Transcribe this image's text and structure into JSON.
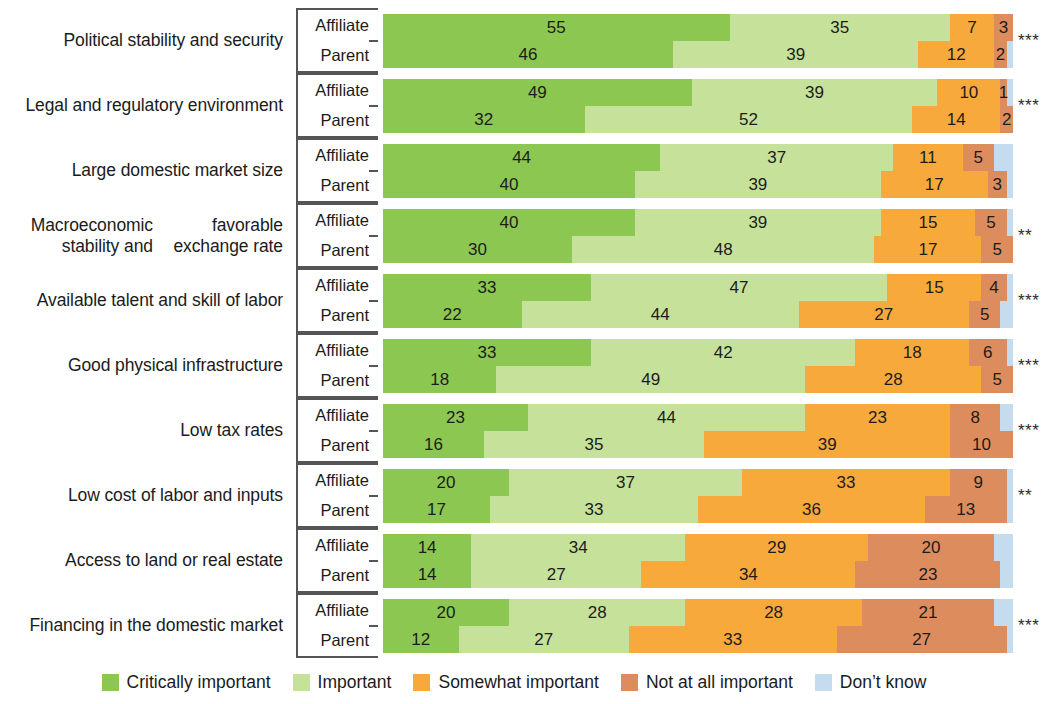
{
  "chart_data": {
    "type": "bar",
    "subtype": "horizontal-stacked-100",
    "title": "",
    "xlabel": "",
    "ylabel": "",
    "xlim": [
      0,
      100
    ],
    "grid": false,
    "legend_position": "bottom",
    "legend": [
      {
        "label": "Critically important",
        "color": "#8CC751"
      },
      {
        "label": "Important",
        "color": "#C6E29A"
      },
      {
        "label": "Somewhat important",
        "color": "#F7A93B"
      },
      {
        "label": "Not at all important",
        "color": "#DD8C5E"
      },
      {
        "label": "Don’t know",
        "color": "#C5DCEF"
      }
    ],
    "series_names": [
      "Affiliate",
      "Parent"
    ],
    "categories": [
      "Political stability and security",
      "Legal and regulatory environment",
      "Large domestic market size",
      "Macroeconomic stability and favorable exchange rate",
      "Available talent and skill of labor",
      "Good physical infrastructure",
      "Low tax rates",
      "Low cost of labor and inputs",
      "Access to land or real estate",
      "Financing in the domestic market"
    ],
    "rows": [
      {
        "category_lines": [
          "Political stability and security"
        ],
        "significance": "***",
        "affiliate": [
          55,
          35,
          7,
          3,
          0
        ],
        "parent": [
          46,
          39,
          12,
          2,
          1
        ]
      },
      {
        "category_lines": [
          "Legal and regulatory environment"
        ],
        "significance": "***",
        "affiliate": [
          49,
          39,
          10,
          1,
          1
        ],
        "parent": [
          32,
          52,
          14,
          2,
          0
        ]
      },
      {
        "category_lines": [
          "Large domestic market size"
        ],
        "significance": "",
        "affiliate": [
          44,
          37,
          11,
          5,
          3
        ],
        "parent": [
          40,
          39,
          17,
          3,
          1
        ]
      },
      {
        "category_lines": [
          "Macroeconomic stability and",
          "favorable exchange rate"
        ],
        "significance": "**",
        "affiliate": [
          40,
          39,
          15,
          5,
          1
        ],
        "parent": [
          30,
          48,
          17,
          5,
          0
        ]
      },
      {
        "category_lines": [
          "Available talent and skill of labor"
        ],
        "significance": "***",
        "affiliate": [
          33,
          47,
          15,
          4,
          1
        ],
        "parent": [
          22,
          44,
          27,
          5,
          2
        ]
      },
      {
        "category_lines": [
          "Good physical infrastructure"
        ],
        "significance": "***",
        "affiliate": [
          33,
          42,
          18,
          6,
          1
        ],
        "parent": [
          18,
          49,
          28,
          5,
          0
        ]
      },
      {
        "category_lines": [
          "Low tax rates"
        ],
        "significance": "***",
        "affiliate": [
          23,
          44,
          23,
          8,
          2
        ],
        "parent": [
          16,
          35,
          39,
          10,
          0
        ]
      },
      {
        "category_lines": [
          "Low cost of labor and inputs"
        ],
        "significance": "**",
        "affiliate": [
          20,
          37,
          33,
          9,
          1
        ],
        "parent": [
          17,
          33,
          36,
          13,
          1
        ]
      },
      {
        "category_lines": [
          "Access to land or real estate"
        ],
        "significance": "",
        "affiliate": [
          14,
          34,
          29,
          20,
          3
        ],
        "parent": [
          14,
          27,
          34,
          23,
          2
        ]
      },
      {
        "category_lines": [
          "Financing in the domestic market"
        ],
        "significance": "***",
        "affiliate": [
          20,
          28,
          28,
          21,
          3
        ],
        "parent": [
          12,
          27,
          33,
          27,
          1
        ]
      }
    ]
  }
}
